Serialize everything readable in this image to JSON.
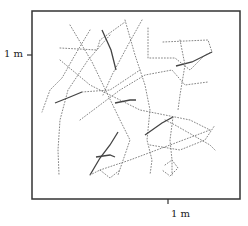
{
  "chart_data": {
    "type": "line",
    "title": "",
    "xlabel": "",
    "ylabel": "",
    "grid": false,
    "legend": "none",
    "axis": {
      "y_tick_label": "1 m",
      "x_tick_label": "1 m"
    },
    "frame": {
      "left": 32,
      "top": 11,
      "right": 240,
      "bottom": 199
    },
    "ticks": {
      "y_tick_px": 55,
      "x_tick_px": 168
    },
    "paths": [
      {
        "style": "dotted",
        "points": [
          [
            70,
            25
          ],
          [
            92,
            62
          ],
          [
            120,
            120
          ],
          [
            130,
            140
          ],
          [
            118,
            175
          ]
        ]
      },
      {
        "style": "dotted",
        "points": [
          [
            60,
            48
          ],
          [
            97,
            50
          ],
          [
            100,
            40
          ],
          [
            125,
            22
          ]
        ]
      },
      {
        "style": "dotted",
        "points": [
          [
            90,
            30
          ],
          [
            75,
            55
          ],
          [
            62,
            78
          ],
          [
            50,
            90
          ],
          [
            42,
            112
          ]
        ]
      },
      {
        "style": "dotted",
        "points": [
          [
            110,
            35
          ],
          [
            88,
            60
          ],
          [
            68,
            90
          ],
          [
            60,
            120
          ],
          [
            58,
            150
          ],
          [
            59,
            175
          ]
        ]
      },
      {
        "style": "dotted",
        "points": [
          [
            125,
            20
          ],
          [
            135,
            55
          ],
          [
            145,
            85
          ],
          [
            150,
            110
          ],
          [
            147,
            140
          ],
          [
            152,
            160
          ],
          [
            150,
            175
          ]
        ]
      },
      {
        "style": "dotted",
        "points": [
          [
            142,
            20
          ],
          [
            128,
            45
          ],
          [
            112,
            75
          ],
          [
            103,
            95
          ]
        ]
      },
      {
        "style": "solid",
        "points": [
          [
            102,
            30
          ],
          [
            111,
            50
          ],
          [
            116,
            70
          ]
        ]
      },
      {
        "style": "dotted",
        "points": [
          [
            148,
            28
          ],
          [
            148,
            58
          ],
          [
            175,
            58
          ],
          [
            190,
            70
          ],
          [
            205,
            55
          ],
          [
            212,
            52
          ]
        ]
      },
      {
        "style": "dotted",
        "points": [
          [
            163,
            42
          ],
          [
            208,
            40
          ],
          [
            212,
            52
          ]
        ]
      },
      {
        "style": "solid",
        "points": [
          [
            176,
            66
          ],
          [
            192,
            62
          ],
          [
            212,
            52
          ]
        ]
      },
      {
        "style": "dotted",
        "points": [
          [
            180,
            40
          ],
          [
            185,
            65
          ],
          [
            180,
            95
          ],
          [
            178,
            110
          ]
        ]
      },
      {
        "style": "dotted",
        "points": [
          [
            80,
            120
          ],
          [
            120,
            90
          ],
          [
            145,
            75
          ],
          [
            172,
            70
          ],
          [
            185,
            85
          ],
          [
            208,
            82
          ]
        ]
      },
      {
        "style": "dotted",
        "points": [
          [
            60,
            60
          ],
          [
            90,
            85
          ],
          [
            140,
            110
          ],
          [
            190,
            120
          ],
          [
            210,
            130
          ]
        ]
      },
      {
        "style": "solid",
        "points": [
          [
            55,
            103
          ],
          [
            70,
            97
          ],
          [
            82,
            92
          ]
        ]
      },
      {
        "style": "dotted",
        "points": [
          [
            82,
            92
          ],
          [
            110,
            90
          ],
          [
            140,
            70
          ]
        ]
      },
      {
        "style": "solid",
        "points": [
          [
            115,
            103
          ],
          [
            130,
            100
          ],
          [
            136,
            100
          ]
        ]
      },
      {
        "style": "dotted",
        "points": [
          [
            165,
            120
          ],
          [
            175,
            125
          ],
          [
            210,
            145
          ],
          [
            215,
            150
          ]
        ]
      },
      {
        "style": "solid",
        "points": [
          [
            145,
            135
          ],
          [
            162,
            123
          ],
          [
            173,
            117
          ]
        ]
      },
      {
        "style": "dotted",
        "points": [
          [
            173,
            117
          ],
          [
            170,
            140
          ],
          [
            172,
            160
          ],
          [
            172,
            175
          ]
        ]
      },
      {
        "style": "dotted",
        "points": [
          [
            150,
            145
          ],
          [
            180,
            150
          ],
          [
            205,
            140
          ],
          [
            215,
            125
          ]
        ]
      },
      {
        "style": "dotted",
        "points": [
          [
            100,
            170
          ],
          [
            130,
            160
          ],
          [
            170,
            145
          ],
          [
            210,
            130
          ]
        ]
      },
      {
        "style": "solid",
        "points": [
          [
            90,
            175
          ],
          [
            100,
            158
          ],
          [
            110,
            145
          ],
          [
            118,
            132
          ]
        ]
      },
      {
        "style": "solid",
        "points": [
          [
            96,
            157
          ],
          [
            110,
            155
          ],
          [
            115,
            157
          ]
        ]
      },
      {
        "style": "dotted",
        "points": [
          [
            90,
            175
          ],
          [
            100,
            170
          ],
          [
            110,
            178
          ],
          [
            120,
            170
          ]
        ]
      },
      {
        "style": "dotted",
        "points": [
          [
            165,
            165
          ],
          [
            172,
            160
          ],
          [
            178,
            168
          ],
          [
            170,
            176
          ],
          [
            162,
            170
          ]
        ]
      }
    ]
  },
  "labels": {
    "y_tick": "1 m",
    "x_tick": "1 m"
  }
}
